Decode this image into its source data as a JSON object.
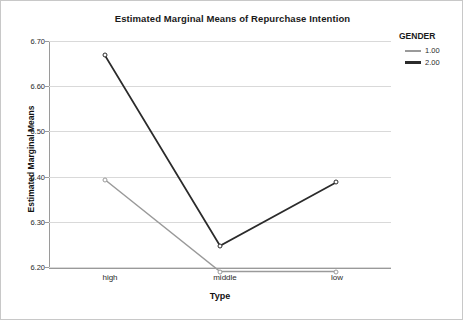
{
  "chart_data": {
    "type": "line",
    "title": "Estimated Marginal Means of Repurchase Intention",
    "xlabel": "Type",
    "ylabel": "Estimated Marginal Means",
    "categories": [
      "high",
      "middle",
      "low"
    ],
    "ylim": [
      6.15,
      6.72
    ],
    "yticks": [
      "6.20",
      "6.30",
      "6.40",
      "6.50",
      "6.60",
      "6.70"
    ],
    "ytick_values": [
      6.2,
      6.3,
      6.4,
      6.5,
      6.6,
      6.7
    ],
    "grid": true,
    "legend_position": "right",
    "legend_title": "GENDER",
    "series": [
      {
        "name": "1.00",
        "color": "#9a9a9a",
        "values": [
          6.393,
          6.19,
          6.19
        ]
      },
      {
        "name": "2.00",
        "color": "#2b2b2b",
        "values": [
          6.668,
          6.247,
          6.387
        ]
      }
    ]
  },
  "legend": {
    "title": "GENDER",
    "items": [
      {
        "label": "1.00",
        "color": "#9a9a9a"
      },
      {
        "label": "2.00",
        "color": "#2b2b2b"
      }
    ]
  },
  "axes": {
    "x_title": "Type",
    "y_title": "Estimated Marginal Means",
    "x_categories": [
      "high",
      "middle",
      "low"
    ],
    "y_ticks": [
      "6.70",
      "6.60",
      "6.50",
      "6.40",
      "6.30",
      "6.20"
    ]
  },
  "title": "Estimated Marginal Means of Repurchase Intention"
}
